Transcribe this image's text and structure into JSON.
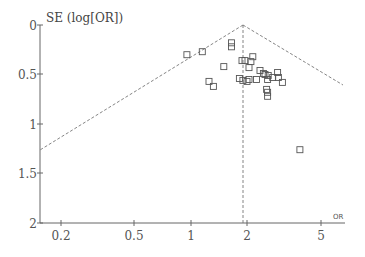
{
  "chart_data": {
    "type": "scatter",
    "subtype": "funnel-plot",
    "title": "",
    "ylabel": "SE (log[OR])",
    "xlabel": "OR",
    "x_scale": "log",
    "x_ticks": [
      0.2,
      0.5,
      1,
      2,
      5
    ],
    "x_tick_labels": [
      "0.2",
      "0.5",
      "1",
      "2",
      "5"
    ],
    "y_ticks": [
      0,
      0.5,
      1,
      1.5,
      2
    ],
    "y_tick_labels": [
      "0",
      "0.5",
      "1",
      "1.5",
      "2"
    ],
    "ylim": [
      2,
      0
    ],
    "y_inverted": true,
    "xlim": [
      0.17,
      6.4
    ],
    "grid": false,
    "legend": null,
    "pooled_or": 1.88,
    "funnel_limits": "pseudo 95% CI (dashed)",
    "points": [
      {
        "or": 0.95,
        "se": 0.3
      },
      {
        "or": 1.15,
        "se": 0.27
      },
      {
        "or": 1.65,
        "se": 0.22
      },
      {
        "or": 1.65,
        "se": 0.18
      },
      {
        "or": 1.5,
        "se": 0.42
      },
      {
        "or": 1.25,
        "se": 0.57
      },
      {
        "or": 1.32,
        "se": 0.62
      },
      {
        "or": 1.88,
        "se": 0.36
      },
      {
        "or": 1.95,
        "se": 0.36
      },
      {
        "or": 2.15,
        "se": 0.32
      },
      {
        "or": 2.1,
        "se": 0.37
      },
      {
        "or": 2.05,
        "se": 0.43
      },
      {
        "or": 1.82,
        "se": 0.54
      },
      {
        "or": 1.9,
        "se": 0.56
      },
      {
        "or": 2.0,
        "se": 0.57
      },
      {
        "or": 2.05,
        "se": 0.55
      },
      {
        "or": 2.25,
        "se": 0.55
      },
      {
        "or": 2.35,
        "se": 0.46
      },
      {
        "or": 2.45,
        "se": 0.49
      },
      {
        "or": 2.5,
        "se": 0.5
      },
      {
        "or": 2.6,
        "se": 0.51
      },
      {
        "or": 2.58,
        "se": 0.55
      },
      {
        "or": 2.75,
        "se": 0.53
      },
      {
        "or": 2.95,
        "se": 0.53
      },
      {
        "or": 2.92,
        "se": 0.48
      },
      {
        "or": 3.1,
        "se": 0.58
      },
      {
        "or": 2.55,
        "se": 0.65
      },
      {
        "or": 2.58,
        "se": 0.68
      },
      {
        "or": 2.58,
        "se": 0.72
      },
      {
        "or": 3.85,
        "se": 1.26
      }
    ]
  },
  "labels": {
    "ylabel": "SE (log[OR])",
    "xlabel": "OR",
    "y0": "0",
    "y05": "0.5",
    "y1": "1",
    "y15": "1.5",
    "y2": "2",
    "x02": "0.2",
    "x05": "0.5",
    "x1": "1",
    "x2": "2",
    "x5": "5"
  }
}
